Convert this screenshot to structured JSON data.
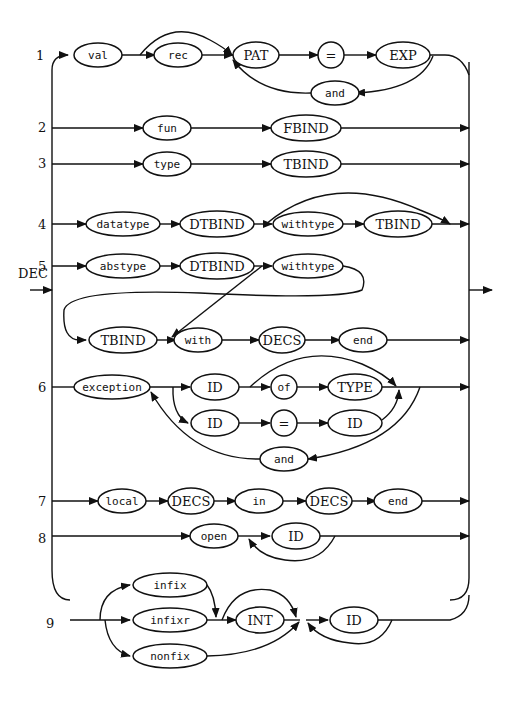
{
  "diagram": {
    "title": "DEC",
    "entry_label": "DEC",
    "rules": [
      {
        "number": "1",
        "nodes": [
          "val",
          "rec",
          "PAT",
          "=",
          "EXP",
          "and"
        ]
      },
      {
        "number": "2",
        "nodes": [
          "fun",
          "FBIND"
        ]
      },
      {
        "number": "3",
        "nodes": [
          "type",
          "TBIND"
        ]
      },
      {
        "number": "4",
        "nodes": [
          "datatype",
          "DTBIND",
          "withtype",
          "TBIND"
        ]
      },
      {
        "number": "5",
        "nodes": [
          "abstype",
          "DTBIND",
          "withtype",
          "TBIND",
          "with",
          "DECS",
          "end"
        ]
      },
      {
        "number": "6",
        "nodes": [
          "exception",
          "ID",
          "of",
          "TYPE",
          "ID",
          "=",
          "ID",
          "and"
        ]
      },
      {
        "number": "7",
        "nodes": [
          "local",
          "DECS",
          "in",
          "DECS",
          "end"
        ]
      },
      {
        "number": "8",
        "nodes": [
          "open",
          "ID"
        ]
      },
      {
        "number": "9",
        "nodes": [
          "infix",
          "infixr",
          "nonfix",
          "INT",
          "ID"
        ]
      }
    ],
    "labels": {
      "r1": {
        "val": "val",
        "rec": "rec",
        "pat": "PAT",
        "eq": "=",
        "exp": "EXP",
        "and": "and"
      },
      "r2": {
        "fun": "fun",
        "fbind": "FBIND"
      },
      "r3": {
        "type": "type",
        "tbind": "TBIND"
      },
      "r4": {
        "datatype": "datatype",
        "dtbind": "DTBIND",
        "withtype": "withtype",
        "tbind": "TBIND"
      },
      "r5": {
        "abstype": "abstype",
        "dtbind": "DTBIND",
        "withtype": "withtype",
        "tbind": "TBIND",
        "with": "with",
        "decs": "DECS",
        "end": "end"
      },
      "r6": {
        "exception": "exception",
        "id1": "ID",
        "of": "of",
        "type": "TYPE",
        "id2": "ID",
        "eq": "=",
        "id3": "ID",
        "and": "and"
      },
      "r7": {
        "local": "local",
        "decs1": "DECS",
        "in": "in",
        "decs2": "DECS",
        "end": "end"
      },
      "r8": {
        "open": "open",
        "id": "ID"
      },
      "r9": {
        "infix": "infix",
        "infixr": "infixr",
        "nonfix": "nonfix",
        "int": "INT",
        "id": "ID"
      }
    }
  }
}
